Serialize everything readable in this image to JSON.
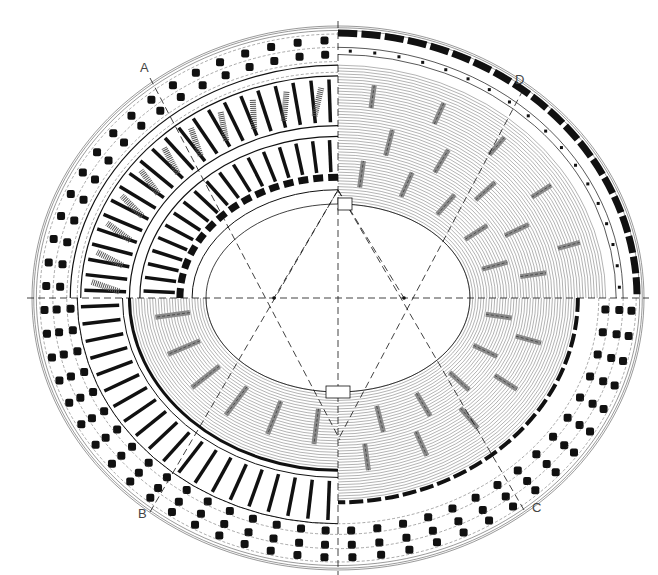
{
  "diagram": {
    "type": "architectural-plan",
    "center": {
      "x": 338,
      "y": 298
    },
    "outer_radii": {
      "rx": 306,
      "ry": 272
    },
    "arena_radii": {
      "rx": 132,
      "ry": 94
    },
    "colors": {
      "ink": "#111111",
      "hatch": "#555555",
      "gray_fill": "#8a8a8a",
      "paper": "#ffffff",
      "label": "#444444"
    },
    "quadrants": [
      {
        "id": "top-left",
        "description": "ground-level plan with radial walls and pillars"
      },
      {
        "id": "top-right",
        "description": "upper seating tiers with stair passages"
      },
      {
        "id": "bottom-left",
        "description": "seating tiers and radial corridors"
      },
      {
        "id": "bottom-right",
        "description": "lower seating tiers with vomitoria"
      }
    ],
    "section_labels": [
      {
        "id": "A",
        "text": "A",
        "x": 140,
        "y": 72
      },
      {
        "id": "B",
        "text": "B",
        "x": 138,
        "y": 518
      },
      {
        "id": "C",
        "text": "C",
        "x": 532,
        "y": 512
      },
      {
        "id": "D",
        "text": "D",
        "x": 515,
        "y": 84
      }
    ],
    "section_lines": [
      {
        "from": "A",
        "x1": 150,
        "y1": 78,
        "x2": 340,
        "y2": 440
      },
      {
        "from": "D",
        "x1": 523,
        "y1": 90,
        "x2": 338,
        "y2": 440
      },
      {
        "from": "B",
        "x1": 150,
        "y1": 512,
        "x2": 338,
        "y2": 190
      },
      {
        "from": "C",
        "x1": 524,
        "y1": 510,
        "x2": 338,
        "y2": 190
      }
    ],
    "construction_foci": [
      {
        "x": 274,
        "y": 298
      },
      {
        "x": 404,
        "y": 298
      }
    ]
  }
}
